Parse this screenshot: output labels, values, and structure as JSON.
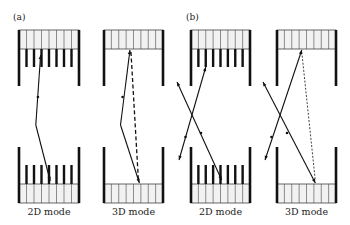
{
  "figure": {
    "panels": [
      {
        "tag": "(a)",
        "tag_pos": [
          13,
          12
        ],
        "subpanels": [
          {
            "label": "2D mode",
            "mode": "2D",
            "left": 19,
            "right": 79,
            "path_type": "scatter-single",
            "dashed": false
          },
          {
            "label": "3D mode",
            "mode": "3D",
            "left": 104,
            "right": 163,
            "path_type": "scatter-single",
            "dashed": true,
            "dash_style": "heavy"
          }
        ]
      },
      {
        "tag": "(b)",
        "tag_pos": [
          186,
          12
        ],
        "subpanels": [
          {
            "label": "2D mode",
            "mode": "2D",
            "left": 191,
            "right": 250,
            "path_type": "crossing",
            "dashed": false
          },
          {
            "label": "3D mode",
            "mode": "3D",
            "left": 277,
            "right": 336,
            "path_type": "crossing",
            "dashed": true,
            "dash_style": "fine"
          }
        ]
      }
    ],
    "geometry": {
      "top_box": [
        30,
        49
      ],
      "top_wall_end": 86,
      "top_septa_end": 67,
      "bottom_wall_start": 147,
      "bottom_box": [
        184,
        203
      ],
      "bottom_septa_start": 165,
      "detector_divisions": 8,
      "label_y": 206
    },
    "colors": {
      "ink": "#111111",
      "box_fill": "#f2f2f2",
      "box_line": "#444444"
    }
  }
}
